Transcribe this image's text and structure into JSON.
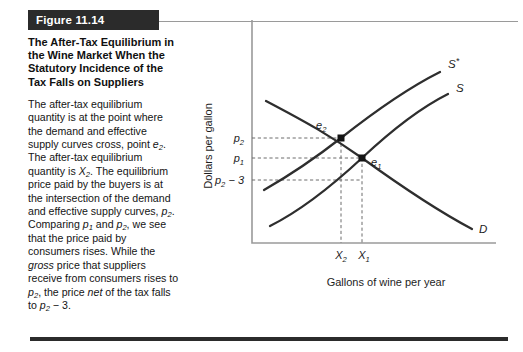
{
  "figure": {
    "number_label": "Figure 11.14",
    "title": "The After-Tax Equilibrium in the Wine Market When the Statutory Incidence of the Tax Falls on Suppliers",
    "caption_segments": [
      {
        "text": "The after-tax equilibrium quantity is at the point where the demand and effective supply curves cross, point ",
        "style": "normal"
      },
      {
        "text": "e",
        "style": "italic"
      },
      {
        "text": "2",
        "style": "sub-italic"
      },
      {
        "text": ". The after-tax equilibrium quantity is ",
        "style": "normal"
      },
      {
        "text": "X",
        "style": "italic"
      },
      {
        "text": "2",
        "style": "sub-italic"
      },
      {
        "text": ". The equilibrium price paid by the buyers is at the intersection of the demand and effective supply curves, ",
        "style": "normal"
      },
      {
        "text": "p",
        "style": "italic"
      },
      {
        "text": "2",
        "style": "sub-italic"
      },
      {
        "text": ". Comparing ",
        "style": "normal"
      },
      {
        "text": "p",
        "style": "italic"
      },
      {
        "text": "1",
        "style": "sub-italic"
      },
      {
        "text": " and ",
        "style": "normal"
      },
      {
        "text": "p",
        "style": "italic"
      },
      {
        "text": "2",
        "style": "sub-italic"
      },
      {
        "text": ", we see that the price paid by consumers rises. While the ",
        "style": "normal"
      },
      {
        "text": "gross",
        "style": "italic"
      },
      {
        "text": " price that suppliers receive from consumers rises to ",
        "style": "normal"
      },
      {
        "text": "p",
        "style": "italic"
      },
      {
        "text": "2",
        "style": "sub-italic"
      },
      {
        "text": ", the price ",
        "style": "normal"
      },
      {
        "text": "net",
        "style": "italic"
      },
      {
        "text": " of the tax falls to ",
        "style": "normal"
      },
      {
        "text": "p",
        "style": "italic"
      },
      {
        "text": "2",
        "style": "sub-italic"
      },
      {
        "text": " − 3.",
        "style": "normal"
      }
    ]
  },
  "chart_data": {
    "type": "line",
    "title": "",
    "xlabel": "Gallons of wine per year",
    "ylabel": "Dollars per gallon",
    "grid": false,
    "legend": "inline-curve-labels",
    "xtick_labels": [
      "X2",
      "X1"
    ],
    "ytick_labels": [
      "p2",
      "p1",
      "p2 − 3"
    ],
    "curves": [
      {
        "name": "S*",
        "label": "S*",
        "role": "effective-supply-after-tax",
        "shape": "upward-sloping-convex",
        "points": [
          [
            0.03,
            0.36
          ],
          [
            0.25,
            0.47
          ],
          [
            0.47,
            0.62
          ],
          [
            0.68,
            0.78
          ],
          [
            0.88,
            0.93
          ]
        ]
      },
      {
        "name": "S",
        "label": "S",
        "role": "original-supply",
        "shape": "upward-sloping-convex",
        "points": [
          [
            0.06,
            0.17
          ],
          [
            0.28,
            0.28
          ],
          [
            0.5,
            0.44
          ],
          [
            0.72,
            0.62
          ],
          [
            0.92,
            0.79
          ]
        ]
      },
      {
        "name": "D",
        "label": "D",
        "role": "demand",
        "shape": "downward-sloping-concave",
        "points": [
          [
            0.04,
            0.92
          ],
          [
            0.26,
            0.77
          ],
          [
            0.48,
            0.62
          ],
          [
            0.7,
            0.44
          ],
          [
            0.94,
            0.22
          ]
        ]
      }
    ],
    "points": [
      {
        "label": "e2",
        "role": "after-tax-equilibrium",
        "x": "X2",
        "y": "p2"
      },
      {
        "label": "e1",
        "role": "pre-tax-equilibrium",
        "x": "X1",
        "y": "p1"
      }
    ],
    "annotations": [
      {
        "type": "hline",
        "from": "p2",
        "to": "e2"
      },
      {
        "type": "hline",
        "from": "p1",
        "to": "e1"
      },
      {
        "type": "hline",
        "from": "p2 − 3",
        "to": "S at X1"
      },
      {
        "type": "vline",
        "from": "e2",
        "to": "X2"
      },
      {
        "type": "vline",
        "from": "e1",
        "to": "X1"
      }
    ]
  },
  "colors": {
    "bar_background": "#2b2b2b",
    "bar_text": "#ffffff",
    "curve": "#2e2e2e",
    "axis": "#9a9a9a",
    "guide": "#6d6d6d",
    "page_background": "#ffffff"
  }
}
